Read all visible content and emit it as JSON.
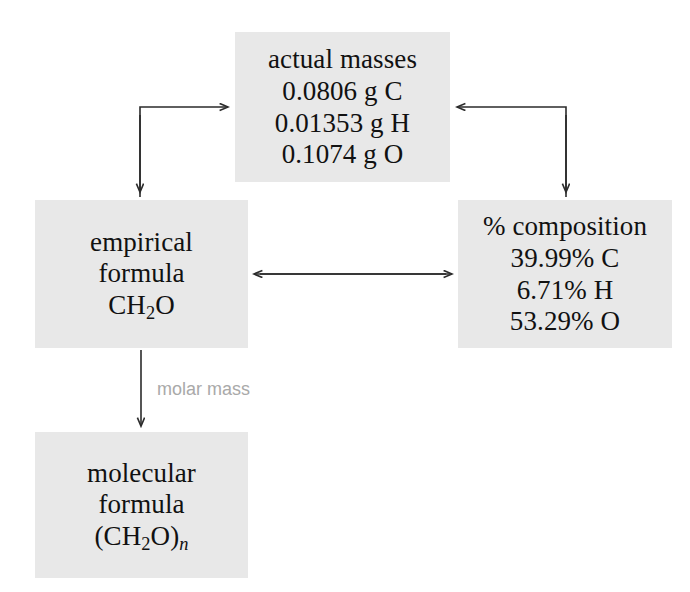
{
  "diagram": {
    "background_color": "#ffffff",
    "box_fill_color": "#e8e8e8",
    "arrow_color": "#2b2b2b",
    "label_color": "#a9a9a9"
  },
  "nodes": {
    "actual_masses": {
      "heading": "actual masses",
      "lines": [
        "0.0806 g C",
        "0.01353 g H",
        "0.1074 g O"
      ]
    },
    "empirical_formula": {
      "heading_line1": "empirical",
      "heading_line2": "formula",
      "formula_prefix": "CH",
      "formula_sub": "2",
      "formula_suffix": "O"
    },
    "percent_composition": {
      "heading": "% composition",
      "lines": [
        "39.99% C",
        "6.71% H",
        "53.29% O"
      ]
    },
    "molecular_formula": {
      "heading_line1": "molecular",
      "heading_line2": "formula",
      "formula_prefix": "(CH",
      "formula_sub": "2",
      "formula_mid": "O)",
      "formula_sub_n": "n"
    }
  },
  "edges": {
    "masses_to_empirical": {
      "name": "elbow arrow from actual masses to empirical formula",
      "direction": "bidirectional-elbow-left"
    },
    "masses_to_composition": {
      "name": "elbow arrow from actual masses to % composition",
      "direction": "bidirectional-elbow-right"
    },
    "empirical_to_composition": {
      "name": "double-headed horizontal arrow",
      "direction": "bidirectional"
    },
    "empirical_to_molecular": {
      "label": "molar mass",
      "direction": "down"
    }
  }
}
